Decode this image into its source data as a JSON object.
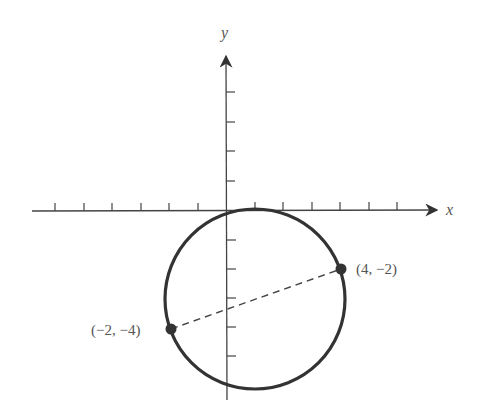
{
  "figure": {
    "x_axis_label": "x",
    "y_axis_label": "y",
    "points": [
      {
        "x": 4,
        "y": -2,
        "label": "(4, −2)"
      },
      {
        "x": -2,
        "y": -4,
        "label": "(−2, −4)"
      }
    ],
    "circle": {
      "center_x": 1,
      "center_y": -3,
      "radius": "√10"
    },
    "segment": {
      "from": "(−2, −4)",
      "to": "(4, −2)",
      "style": "dashed"
    },
    "x_ticks": [
      -7,
      -6,
      -5,
      -4,
      -3,
      -2,
      -1,
      1,
      2,
      3,
      4,
      5,
      6,
      7
    ],
    "y_ticks": [
      4,
      3,
      2,
      1,
      -1,
      -2,
      -3,
      -4,
      -5,
      -6
    ],
    "colors": {
      "curve": "#333333",
      "axis": "#444444",
      "label": "#555555"
    }
  }
}
